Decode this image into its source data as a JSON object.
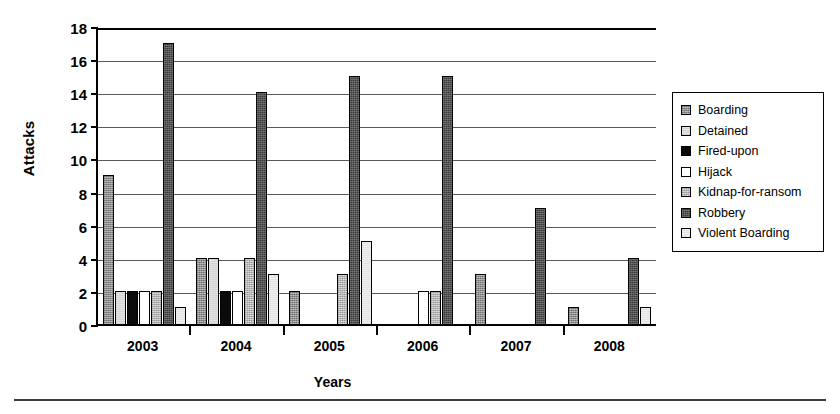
{
  "chart_data": {
    "type": "bar",
    "title": "",
    "xlabel": "Years",
    "ylabel": "Attacks",
    "categories": [
      "2003",
      "2004",
      "2005",
      "2006",
      "2007",
      "2008"
    ],
    "ylim": [
      0,
      18
    ],
    "ytick_step": 2,
    "yticks": [
      18,
      16,
      14,
      12,
      10,
      8,
      6,
      4,
      2,
      0
    ],
    "grid": "horizontal",
    "legend_position": "right",
    "series": [
      {
        "name": "Boarding",
        "fill": "medium-grey-hatch",
        "values": [
          9,
          4,
          2,
          0,
          3,
          1
        ]
      },
      {
        "name": "Detained",
        "fill": "light-grey",
        "values": [
          2,
          4,
          0,
          0,
          0,
          0
        ]
      },
      {
        "name": "Fired-upon",
        "fill": "black",
        "values": [
          2,
          2,
          0,
          0,
          0,
          0
        ]
      },
      {
        "name": "Hijack",
        "fill": "white",
        "values": [
          2,
          2,
          0,
          2,
          0,
          0
        ]
      },
      {
        "name": "Kidnap-for-ransom",
        "fill": "grey-hatch",
        "values": [
          2,
          4,
          3,
          2,
          0,
          0
        ]
      },
      {
        "name": "Robbery",
        "fill": "dark-grey-hatch",
        "values": [
          17,
          14,
          15,
          15,
          7,
          4
        ]
      },
      {
        "name": "Violent Boarding",
        "fill": "very-light-grey",
        "values": [
          1,
          3,
          5,
          0,
          0,
          1
        ]
      }
    ]
  },
  "axes": {
    "y_title": "Attacks",
    "x_title": "Years"
  },
  "legend": {
    "items": [
      {
        "label": "Boarding"
      },
      {
        "label": "Detained"
      },
      {
        "label": "Fired-upon"
      },
      {
        "label": "Hijack"
      },
      {
        "label": "Kidnap-for-ransom"
      },
      {
        "label": "Robbery"
      },
      {
        "label": "Violent Boarding"
      }
    ]
  },
  "colors": {
    "axis": "#000000",
    "gridline": "#5a5a5a",
    "boarding": "#8e8e8e",
    "detained": "#e3e3e3",
    "fired_upon": "#0a0a0a",
    "hijack": "#ffffff",
    "kidnap": "#b4b4b4",
    "robbery": "#3a3a3a",
    "violent_boarding": "#efefef"
  }
}
